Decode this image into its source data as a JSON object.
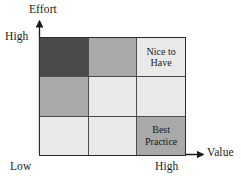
{
  "figure": {
    "type": "matrix",
    "rows": 3,
    "columns": 3
  },
  "axes": {
    "y": {
      "title": "Effort",
      "high_label": "High",
      "low_label": "Low"
    },
    "x": {
      "title": "Value",
      "low_label": "Low",
      "high_label": "High"
    }
  },
  "colors": {
    "dark": "#4a4a4a",
    "medium": "#a9a9a9",
    "light": "#e9e9e9",
    "grid_line": "#4d4d4d",
    "border": "#2b2b2b",
    "text": "#1a1a1a"
  },
  "cells": [
    {
      "id": "r1c1",
      "row": 1,
      "col": 1,
      "shade": "dark",
      "fill": "#4a4a4a",
      "label": ""
    },
    {
      "id": "r1c2",
      "row": 1,
      "col": 2,
      "shade": "medium",
      "fill": "#a9a9a9",
      "label": ""
    },
    {
      "id": "r1c3",
      "row": 1,
      "col": 3,
      "shade": "light",
      "fill": "#e9e9e9",
      "label": "Nice to\nHave"
    },
    {
      "id": "r2c1",
      "row": 2,
      "col": 1,
      "shade": "medium",
      "fill": "#a9a9a9",
      "label": ""
    },
    {
      "id": "r2c2",
      "row": 2,
      "col": 2,
      "shade": "light",
      "fill": "#e9e9e9",
      "label": ""
    },
    {
      "id": "r2c3",
      "row": 2,
      "col": 3,
      "shade": "light",
      "fill": "#e9e9e9",
      "label": ""
    },
    {
      "id": "r3c1",
      "row": 3,
      "col": 1,
      "shade": "light",
      "fill": "#e9e9e9",
      "label": ""
    },
    {
      "id": "r3c2",
      "row": 3,
      "col": 2,
      "shade": "light",
      "fill": "#e9e9e9",
      "label": ""
    },
    {
      "id": "r3c3",
      "row": 3,
      "col": 3,
      "shade": "medium",
      "fill": "#a9a9a9",
      "label": "Best\nPractice"
    }
  ]
}
